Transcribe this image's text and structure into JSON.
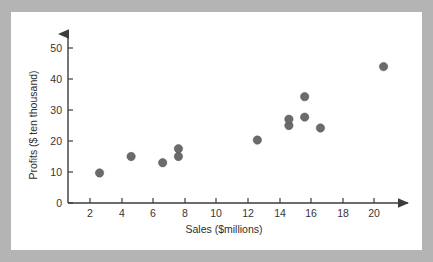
{
  "chart_data": {
    "type": "scatter",
    "title": "",
    "xlabel": "Sales ($millions)",
    "ylabel": "Profits ($ ten thousand)",
    "xlim": [
      0,
      21.5
    ],
    "ylim": [
      0,
      52
    ],
    "xticks": [
      2,
      4,
      6,
      8,
      10,
      12,
      14,
      16,
      18,
      20
    ],
    "xtick_labels": [
      "2",
      "4",
      "6",
      "8",
      "10",
      "12",
      "14",
      "16",
      "18",
      "20"
    ],
    "yticks": [
      0,
      10,
      20,
      30,
      40,
      50
    ],
    "ytick_labels": [
      "0",
      "10",
      "20",
      "30",
      "40",
      "50"
    ],
    "grid": false,
    "legend": "none",
    "points": [
      {
        "x": 2,
        "y": 9.7
      },
      {
        "x": 4,
        "y": 15.0
      },
      {
        "x": 6,
        "y": 13.0
      },
      {
        "x": 7,
        "y": 15.0
      },
      {
        "x": 7,
        "y": 17.5
      },
      {
        "x": 12,
        "y": 20.3
      },
      {
        "x": 14,
        "y": 25.0
      },
      {
        "x": 14,
        "y": 27.0
      },
      {
        "x": 15,
        "y": 27.7
      },
      {
        "x": 15,
        "y": 34.3
      },
      {
        "x": 16,
        "y": 24.2
      },
      {
        "x": 20,
        "y": 44.0
      }
    ],
    "marker": {
      "shape": "circle",
      "color": "#6b6b6b",
      "size": 4.2
    }
  },
  "figure": {
    "panel_background": "#ffffff",
    "outer_background": "#b4b4b4",
    "axis_color": "#3c3c3c",
    "axis_style": "arrow-tipped"
  }
}
